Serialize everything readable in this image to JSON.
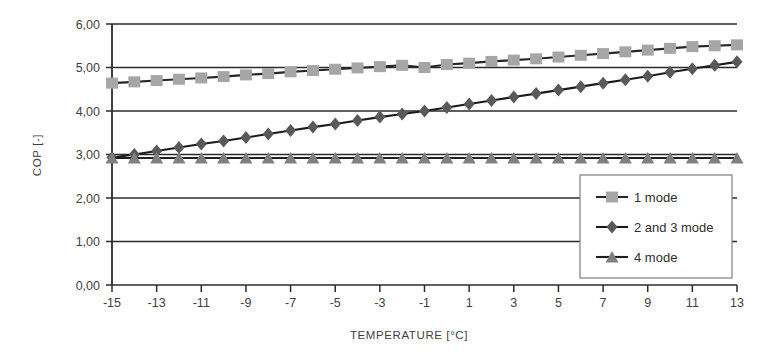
{
  "chart_data": {
    "type": "line",
    "title": "",
    "subtitle": "",
    "xlabel": "TEMPERATURE [°C]",
    "ylabel": "COP [-]",
    "xlim": [
      -15,
      13
    ],
    "ylim": [
      0,
      6
    ],
    "xticks": [
      "-15",
      "-13",
      "-11",
      "-9",
      "-7",
      "-5",
      "-3",
      "-1",
      "1",
      "3",
      "5",
      "7",
      "9",
      "11",
      "13"
    ],
    "xtick_values": [
      -15,
      -13,
      -11,
      -9,
      -7,
      -5,
      -3,
      -1,
      1,
      3,
      5,
      7,
      9,
      11,
      13
    ],
    "yticks": [
      "0,00",
      "1,00",
      "2,00",
      "3,00",
      "4,00",
      "5,00",
      "6,00"
    ],
    "ytick_values": [
      0,
      1,
      2,
      3,
      4,
      5,
      6
    ],
    "grid": "horizontal",
    "legend_position": "bottom-right",
    "x": [
      -15,
      -14,
      -13,
      -12,
      -11,
      -10,
      -9,
      -8,
      -7,
      -6,
      -5,
      -4,
      -3,
      -2,
      -1,
      0,
      1,
      2,
      3,
      4,
      5,
      6,
      7,
      8,
      9,
      10,
      11,
      12,
      13
    ],
    "series": [
      {
        "name": "1 mode",
        "marker": "square",
        "color": "#a6a6a6",
        "line_color": "#262626",
        "values": [
          4.64,
          4.67,
          4.7,
          4.73,
          4.76,
          4.79,
          4.83,
          4.86,
          4.9,
          4.93,
          4.96,
          4.99,
          5.02,
          5.05,
          5.0,
          5.07,
          5.1,
          5.14,
          5.17,
          5.2,
          5.24,
          5.28,
          5.32,
          5.36,
          5.4,
          5.44,
          5.48,
          5.5,
          5.52
        ]
      },
      {
        "name": "2 and 3 mode",
        "marker": "diamond",
        "color": "#595959",
        "line_color": "#1a1a1a",
        "values": [
          2.93,
          3.0,
          3.08,
          3.16,
          3.24,
          3.31,
          3.39,
          3.47,
          3.55,
          3.63,
          3.7,
          3.78,
          3.86,
          3.93,
          4.0,
          4.08,
          4.16,
          4.24,
          4.32,
          4.4,
          4.48,
          4.56,
          4.64,
          4.72,
          4.8,
          4.89,
          4.97,
          5.05,
          5.13
        ]
      },
      {
        "name": "4 mode",
        "marker": "triangle",
        "color": "#808080",
        "line_color": "#1f1f1f",
        "values": [
          2.92,
          2.92,
          2.92,
          2.92,
          2.92,
          2.92,
          2.92,
          2.92,
          2.92,
          2.92,
          2.92,
          2.92,
          2.92,
          2.92,
          2.92,
          2.92,
          2.92,
          2.92,
          2.92,
          2.92,
          2.92,
          2.92,
          2.92,
          2.92,
          2.92,
          2.92,
          2.92,
          2.92,
          2.92
        ]
      }
    ]
  }
}
